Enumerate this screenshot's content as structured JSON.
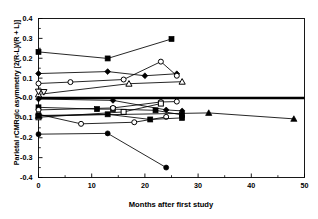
{
  "chart": {
    "title": "",
    "ylabel": "Parietal rCMRglc asymmetry [2(R-L)/(R + L)]",
    "xlabel": "Months after first study",
    "yticks": [
      "0.4",
      "0.3",
      "0.2",
      "0.1",
      "-0.0",
      "-0.1",
      "-0.2",
      "-0.3",
      "-0.4"
    ],
    "xticks": [
      "0",
      "10",
      "20",
      "30",
      "40",
      "50"
    ]
  },
  "chart_data": {
    "type": "line",
    "title": "",
    "xlabel": "Months after first study",
    "ylabel": "Parietal rCMRglc asymmetry [2(R-L)/(R + L)]",
    "xlim": [
      0,
      50
    ],
    "ylim": [
      -0.4,
      0.4
    ],
    "xticks": [
      0,
      10,
      20,
      30,
      40,
      50
    ],
    "xminorticks": [
      5,
      15,
      25,
      35,
      45
    ],
    "yticks": [
      0.4,
      0.3,
      0.2,
      0.1,
      -0.0,
      -0.1,
      -0.2,
      -0.3,
      -0.4
    ],
    "yticklabels": [
      "0.4",
      "0.3",
      "0.2",
      "0.1",
      "-0.0",
      "-0.1",
      "-0.2",
      "-0.3",
      "-0.4"
    ],
    "grid": false,
    "legend": "none",
    "reference_line": {
      "y": 0.0,
      "style": "thick-solid",
      "color": "#000000"
    },
    "series": [
      {
        "name": "subject-1",
        "marker": "filled-square",
        "x": [
          0,
          13,
          25
        ],
        "y": [
          0.232,
          0.199,
          0.297
        ]
      },
      {
        "name": "subject-2",
        "marker": "filled-diamond",
        "x": [
          0,
          13,
          20,
          26
        ],
        "y": [
          0.123,
          0.133,
          0.112,
          0.122
        ]
      },
      {
        "name": "subject-3",
        "marker": "open-circle",
        "x": [
          0,
          6,
          16,
          23,
          26
        ],
        "y": [
          0.073,
          0.08,
          0.093,
          0.183,
          0.112
        ]
      },
      {
        "name": "subject-4",
        "marker": "open-triangle",
        "x": [
          0,
          17,
          27
        ],
        "y": [
          0.018,
          0.072,
          0.082
        ]
      },
      {
        "name": "subject-5",
        "marker": "open-triangle-down",
        "x": [
          0,
          1
        ],
        "y": [
          0.032,
          0.03
        ]
      },
      {
        "name": "subject-6",
        "marker": "filled-diamond",
        "x": [
          0,
          14,
          24,
          27
        ],
        "y": [
          -0.005,
          -0.012,
          -0.06,
          -0.065
        ]
      },
      {
        "name": "subject-7",
        "marker": "filled-square",
        "x": [
          0,
          11,
          14,
          22,
          27
        ],
        "y": [
          -0.047,
          -0.056,
          -0.056,
          -0.062,
          -0.085
        ]
      },
      {
        "name": "subject-8",
        "marker": "open-circle",
        "x": [
          0,
          14,
          23,
          26
        ],
        "y": [
          -0.06,
          -0.05,
          -0.02,
          -0.018
        ]
      },
      {
        "name": "subject-9",
        "marker": "open-square",
        "x": [
          0,
          16,
          23
        ],
        "y": [
          -0.097,
          -0.07,
          -0.028
        ]
      },
      {
        "name": "subject-10",
        "marker": "open-circle",
        "x": [
          0,
          8,
          18,
          24
        ],
        "y": [
          -0.082,
          -0.13,
          -0.122,
          -0.095
        ]
      },
      {
        "name": "subject-11",
        "marker": "filled-square",
        "x": [
          0,
          13,
          21,
          27
        ],
        "y": [
          -0.088,
          -0.082,
          -0.108,
          -0.1
        ]
      },
      {
        "name": "subject-12",
        "marker": "filled-triangle",
        "x": [
          0,
          32,
          48
        ],
        "y": [
          -0.09,
          -0.075,
          -0.105
        ]
      },
      {
        "name": "subject-13",
        "marker": "filled-circle",
        "x": [
          0,
          13,
          24
        ],
        "y": [
          -0.182,
          -0.178,
          -0.35
        ]
      }
    ]
  }
}
